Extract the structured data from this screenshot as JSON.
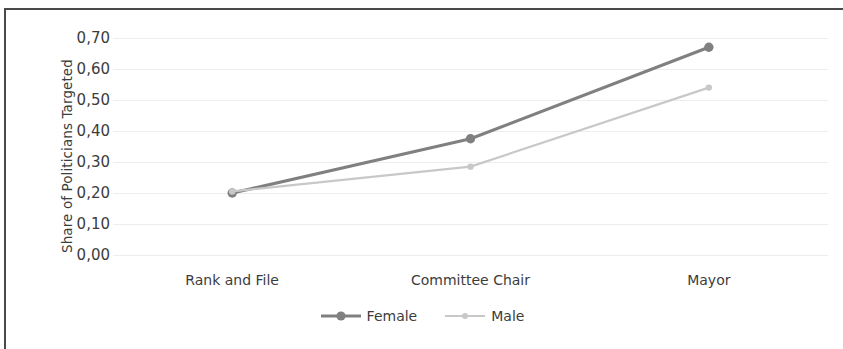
{
  "chart_data": {
    "type": "line",
    "title": "",
    "xlabel": "",
    "ylabel": "Share of Politicians Targeted",
    "categories": [
      "Rank and File",
      "Committee Chair",
      "Mayor"
    ],
    "series": [
      {
        "name": "Female",
        "values": [
          0.2,
          0.375,
          0.67
        ],
        "color": "#808080",
        "line_width": 3.2,
        "marker": "circle",
        "marker_size": 7
      },
      {
        "name": "Male",
        "values": [
          0.205,
          0.285,
          0.54
        ],
        "color": "#c8c8c8",
        "line_width": 2.2,
        "marker": "circle",
        "marker_size": 4
      }
    ],
    "ylim": [
      0.0,
      0.7
    ],
    "ytick_values": [
      0.0,
      0.1,
      0.2,
      0.3,
      0.4,
      0.5,
      0.6,
      0.7
    ],
    "ytick_labels": [
      "0,00",
      "0,10",
      "0,20",
      "0,30",
      "0,40",
      "0,50",
      "0,60",
      "0,70"
    ],
    "grid": "horizontal",
    "legend_position": "bottom-center",
    "decimal_separator": ","
  },
  "legend": {
    "entries": [
      {
        "label": "Female"
      },
      {
        "label": "Male"
      }
    ]
  },
  "colors": {
    "female_series": "#808080",
    "male_series": "#c8c8c8",
    "gridline": "#ededed",
    "text": "#3c3c3c",
    "page_border": "#4a4a4a",
    "background": "#ffffff"
  }
}
